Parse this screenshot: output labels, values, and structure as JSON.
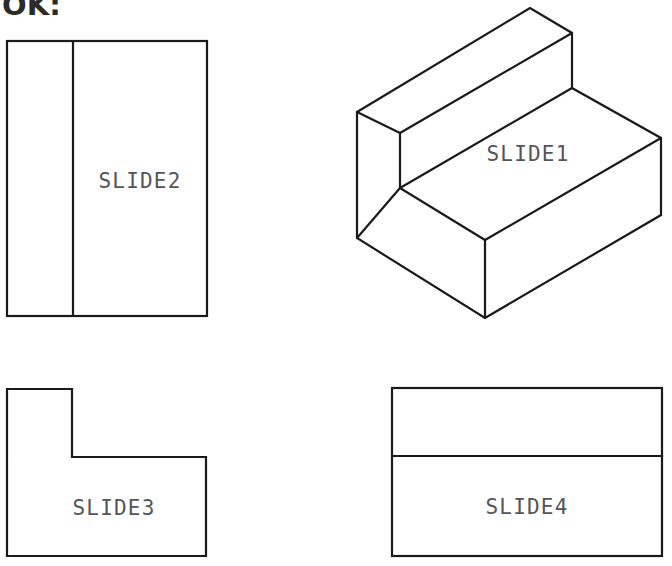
{
  "header": {
    "fragment_text": "OK:"
  },
  "drawing": {
    "title": "Orthographic and isometric views of a stepped L-block",
    "stroke_color": "#1a1a1a",
    "label_color": "#555558",
    "background_color": "#ffffff",
    "line_width": 2.2
  },
  "views": [
    {
      "id": "slide1",
      "label": "SLIDE1",
      "type": "isometric-pictorial",
      "label_x": 528,
      "label_y": 155,
      "outline_points": "357,112 530,8 572,33 572,88 661,138 661,215 485,318 357,238",
      "edges": [
        {
          "name": "top-back-face-left",
          "points": "357,112 400,133"
        },
        {
          "name": "step-top-face",
          "points": "400,133 572,33"
        },
        {
          "name": "step-riser-vertical",
          "points": "400,133 400,188"
        },
        {
          "name": "step-seat-front",
          "points": "400,188 572,88"
        },
        {
          "name": "step-inner-left",
          "points": "357,238 400,188"
        },
        {
          "name": "front-vertical-right",
          "points": "485,240 485,318"
        },
        {
          "name": "front-top-left-run",
          "points": "400,188 485,240"
        },
        {
          "name": "front-top-right-run",
          "points": "485,240 661,138"
        }
      ]
    },
    {
      "id": "slide2",
      "label": "SLIDE2",
      "type": "orthographic-front",
      "label_x": 140,
      "label_y": 182,
      "rect": {
        "x": 7,
        "y": 41,
        "width": 200,
        "height": 275
      },
      "divider": {
        "orientation": "vertical",
        "x": 73,
        "y1": 41,
        "y2": 316
      }
    },
    {
      "id": "slide3",
      "label": "SLIDE3",
      "type": "orthographic-side",
      "label_x": 114,
      "label_y": 509,
      "outline_points": "7,389 72,389 72,457 206,457 206,556 7,556"
    },
    {
      "id": "slide4",
      "label": "SLIDE4",
      "type": "orthographic-top",
      "label_x": 527,
      "label_y": 508,
      "rect": {
        "x": 392,
        "y": 388,
        "width": 270,
        "height": 168
      },
      "divider": {
        "orientation": "horizontal",
        "y": 456,
        "x1": 392,
        "x2": 662
      }
    }
  ]
}
